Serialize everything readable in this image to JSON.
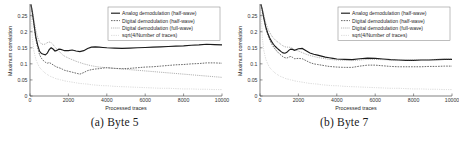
{
  "figure": {
    "panels": [
      {
        "caption": "(a) Byte 5",
        "chart_data": {
          "type": "line",
          "title": "",
          "xlabel": "Processed traces",
          "ylabel": "Maximum correlation",
          "xlim": [
            0,
            10000
          ],
          "ylim": [
            0,
            0.28
          ],
          "xticks": [
            0,
            2000,
            4000,
            6000,
            8000,
            10000
          ],
          "xticklabels": [
            "0",
            "2000",
            "4000",
            "6000",
            "8000",
            "10000"
          ],
          "yticks": [
            0,
            0.05,
            0.1,
            0.15,
            0.2,
            0.25
          ],
          "yticklabels": [
            "0",
            "0.05",
            "0.1",
            "0.15",
            "0.2",
            "0.25"
          ],
          "grid": false,
          "legend_position": "top-right",
          "x": [
            50,
            120,
            200,
            300,
            400,
            500,
            600,
            700,
            800,
            900,
            1000,
            1100,
            1200,
            1300,
            1400,
            1500,
            1600,
            1700,
            1800,
            2000,
            2200,
            2400,
            2600,
            2800,
            3000,
            3200,
            3400,
            3600,
            3800,
            4000,
            4400,
            4800,
            5200,
            5600,
            6000,
            6400,
            6800,
            7200,
            7600,
            8000,
            8400,
            8800,
            9200,
            9600,
            10000
          ],
          "series": [
            {
              "name": "Analog demodulation (half-wave)",
              "style": "solid",
              "values": [
                0.285,
                0.262,
                0.228,
                0.185,
                0.158,
                0.139,
                0.132,
                0.13,
                0.128,
                0.133,
                0.144,
                0.15,
                0.146,
                0.14,
                0.142,
                0.146,
                0.145,
                0.143,
                0.141,
                0.141,
                0.143,
                0.14,
                0.138,
                0.141,
                0.148,
                0.152,
                0.153,
                0.152,
                0.151,
                0.15,
                0.149,
                0.148,
                0.149,
                0.15,
                0.151,
                0.152,
                0.153,
                0.154,
                0.155,
                0.156,
                0.158,
                0.159,
                0.161,
                0.16,
                0.159
              ]
            },
            {
              "name": "Digital demodulation (half-wave)",
              "style": "dashed",
              "values": [
                0.283,
                0.258,
                0.222,
                0.178,
                0.15,
                0.128,
                0.117,
                0.11,
                0.105,
                0.102,
                0.104,
                0.101,
                0.097,
                0.093,
                0.09,
                0.088,
                0.086,
                0.083,
                0.08,
                0.077,
                0.074,
                0.071,
                0.068,
                0.073,
                0.079,
                0.082,
                0.084,
                0.085,
                0.087,
                0.088,
                0.086,
                0.085,
                0.086,
                0.088,
                0.09,
                0.091,
                0.093,
                0.095,
                0.097,
                0.098,
                0.1,
                0.101,
                0.103,
                0.103,
                0.102
              ]
            },
            {
              "name": "Digital demodulation (full-wave)",
              "style": "dotted",
              "values": [
                0.284,
                0.268,
                0.24,
                0.205,
                0.182,
                0.168,
                0.162,
                0.16,
                0.162,
                0.166,
                0.168,
                0.166,
                0.16,
                0.152,
                0.146,
                0.14,
                0.134,
                0.128,
                0.124,
                0.118,
                0.113,
                0.108,
                0.104,
                0.1,
                0.097,
                0.094,
                0.092,
                0.09,
                0.089,
                0.088,
                0.086,
                0.084,
                0.082,
                0.08,
                0.078,
                0.076,
                0.074,
                0.072,
                0.07,
                0.068,
                0.066,
                0.064,
                0.062,
                0.06,
                0.058
              ]
            },
            {
              "name": "sqrt(4/Number of traces)",
              "style": "fine-dotted",
              "values": [
                0.283,
                0.182,
                0.141,
                0.115,
                0.1,
                0.089,
                0.082,
                0.076,
                0.071,
                0.067,
                0.063,
                0.06,
                0.058,
                0.055,
                0.053,
                0.052,
                0.05,
                0.049,
                0.047,
                0.045,
                0.043,
                0.041,
                0.039,
                0.038,
                0.037,
                0.035,
                0.034,
                0.033,
                0.032,
                0.032,
                0.03,
                0.029,
                0.028,
                0.027,
                0.026,
                0.025,
                0.024,
                0.024,
                0.023,
                0.022,
                0.022,
                0.021,
                0.021,
                0.02,
                0.02
              ]
            }
          ]
        }
      },
      {
        "caption": "(b) Byte 7",
        "chart_data": {
          "type": "line",
          "title": "",
          "xlabel": "Processed traces",
          "ylabel": "Maximum correlation",
          "xlim": [
            0,
            10000
          ],
          "ylim": [
            0,
            0.28
          ],
          "xticks": [
            0,
            2000,
            4000,
            6000,
            8000,
            10000
          ],
          "xticklabels": [
            "0",
            "2000",
            "4000",
            "6000",
            "8000",
            "10000"
          ],
          "yticks": [
            0,
            0.05,
            0.1,
            0.15,
            0.2,
            0.25
          ],
          "yticklabels": [
            "0",
            "0.05",
            "0.1",
            "0.15",
            "0.2",
            "0.25"
          ],
          "grid": false,
          "legend_position": "top-right",
          "x": [
            50,
            120,
            200,
            300,
            400,
            500,
            600,
            700,
            800,
            900,
            1000,
            1100,
            1200,
            1300,
            1400,
            1500,
            1600,
            1700,
            1800,
            2000,
            2200,
            2400,
            2600,
            2800,
            3000,
            3200,
            3400,
            3600,
            3800,
            4000,
            4400,
            4800,
            5200,
            5600,
            6000,
            6400,
            6800,
            7200,
            7600,
            8000,
            8400,
            8800,
            9200,
            9600,
            10000
          ],
          "series": [
            {
              "name": "Analog demodulation (half-wave)",
              "style": "solid",
              "values": [
                0.285,
                0.268,
                0.243,
                0.215,
                0.196,
                0.181,
                0.17,
                0.161,
                0.154,
                0.148,
                0.143,
                0.138,
                0.134,
                0.133,
                0.136,
                0.142,
                0.146,
                0.145,
                0.142,
                0.147,
                0.148,
                0.141,
                0.134,
                0.13,
                0.127,
                0.124,
                0.121,
                0.119,
                0.117,
                0.115,
                0.114,
                0.113,
                0.116,
                0.118,
                0.117,
                0.115,
                0.113,
                0.112,
                0.111,
                0.111,
                0.112,
                0.112,
                0.113,
                0.114,
                0.114
              ]
            },
            {
              "name": "Digital demodulation (half-wave)",
              "style": "dashed",
              "values": [
                0.284,
                0.266,
                0.24,
                0.211,
                0.191,
                0.175,
                0.163,
                0.153,
                0.145,
                0.138,
                0.132,
                0.127,
                0.122,
                0.119,
                0.118,
                0.121,
                0.123,
                0.12,
                0.116,
                0.117,
                0.116,
                0.11,
                0.104,
                0.1,
                0.098,
                0.096,
                0.094,
                0.092,
                0.091,
                0.09,
                0.089,
                0.089,
                0.093,
                0.096,
                0.096,
                0.094,
                0.092,
                0.091,
                0.091,
                0.091,
                0.091,
                0.092,
                0.092,
                0.093,
                0.093
              ]
            },
            {
              "name": "Digital demodulation (full-wave)",
              "style": "dotted",
              "values": [
                0.286,
                0.272,
                0.252,
                0.228,
                0.211,
                0.198,
                0.188,
                0.18,
                0.174,
                0.169,
                0.165,
                0.16,
                0.156,
                0.153,
                0.152,
                0.152,
                0.151,
                0.148,
                0.144,
                0.14,
                0.135,
                0.13,
                0.126,
                0.123,
                0.12,
                0.118,
                0.116,
                0.114,
                0.113,
                0.112,
                0.111,
                0.11,
                0.112,
                0.114,
                0.114,
                0.113,
                0.112,
                0.112,
                0.112,
                0.112,
                0.113,
                0.113,
                0.114,
                0.115,
                0.115
              ]
            },
            {
              "name": "sqrt(4/Number of traces)",
              "style": "fine-dotted",
              "values": [
                0.283,
                0.182,
                0.141,
                0.115,
                0.1,
                0.089,
                0.082,
                0.076,
                0.071,
                0.067,
                0.063,
                0.06,
                0.058,
                0.055,
                0.053,
                0.052,
                0.05,
                0.049,
                0.047,
                0.045,
                0.043,
                0.041,
                0.039,
                0.038,
                0.037,
                0.035,
                0.034,
                0.033,
                0.032,
                0.032,
                0.03,
                0.029,
                0.028,
                0.027,
                0.026,
                0.025,
                0.024,
                0.024,
                0.023,
                0.022,
                0.022,
                0.021,
                0.021,
                0.02,
                0.02
              ]
            }
          ]
        }
      }
    ]
  }
}
